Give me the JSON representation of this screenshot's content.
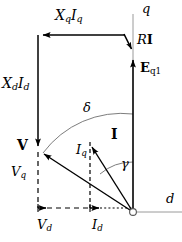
{
  "figure": {
    "type": "phasor-diagram",
    "background_color": "#ffffff",
    "stroke_color": "#000000",
    "axis_color": "#808080",
    "width": 182,
    "height": 242
  },
  "labels": {
    "xq_iq": {
      "text": "XqIq",
      "main1": "X",
      "sub1": "q",
      "main2": "I",
      "sub2": "q",
      "x": 55,
      "y": 10
    },
    "xd_id": {
      "text": "XdId",
      "main1": "X",
      "sub1": "d",
      "main2": "I",
      "sub2": "d",
      "x": 2,
      "y": 78
    },
    "q_axis": {
      "text": "q",
      "x": 142,
      "y": 4
    },
    "d_axis": {
      "text": "d",
      "x": 166,
      "y": 196
    },
    "r_i": {
      "text": "RI",
      "main1": "R",
      "main2": "I",
      "x": 137,
      "y": 35
    },
    "e_q1": {
      "text": "Eq1",
      "main1": "E",
      "sub1": "q1",
      "x": 141,
      "y": 63
    },
    "v_phasor": {
      "text": "V",
      "x": 18,
      "y": 140
    },
    "v_q": {
      "text": "Vq",
      "main1": "V",
      "sub1": "q",
      "x": 12,
      "y": 168
    },
    "v_d": {
      "text": "Vd",
      "main1": "V",
      "sub1": "d",
      "x": 38,
      "y": 220
    },
    "i_phasor": {
      "text": "I",
      "x": 112,
      "y": 129
    },
    "i_q": {
      "text": "Iq",
      "main1": "I",
      "sub1": "q",
      "x": 79,
      "y": 146
    },
    "i_d": {
      "text": "Id",
      "main1": "I",
      "sub1": "d",
      "x": 93,
      "y": 220
    },
    "delta": {
      "text": "δ",
      "x": 83,
      "y": 103
    },
    "gamma": {
      "text": "γ",
      "x": 121,
      "y": 160
    }
  },
  "geometry": {
    "origin": {
      "x": 133,
      "y": 212
    },
    "v_point": {
      "x": 38,
      "y": 150
    },
    "top_left_corner": {
      "x": 38,
      "y": 35
    },
    "top_right_corner": {
      "x": 125,
      "y": 35
    },
    "eq_tip": {
      "x": 133,
      "y": 55
    },
    "i_tip": {
      "x": 90,
      "y": 140
    },
    "q_axis_top": {
      "x": 133,
      "y": 14
    },
    "d_axis_right": {
      "x": 182,
      "y": 212
    },
    "v_foot": {
      "x": 38,
      "y": 212
    },
    "i_foot": {
      "x": 90,
      "y": 212
    }
  },
  "vectors": [
    {
      "name": "XqIq",
      "from": "top-right-corner",
      "to": "top-left-corner",
      "direction": "left",
      "style": "solid"
    },
    {
      "name": "XdId",
      "from": "top-left-corner",
      "to": "v-point",
      "direction": "down",
      "style": "solid"
    },
    {
      "name": "RI",
      "from": "top-right-corner",
      "to": "eq-tip",
      "direction": "down-right",
      "style": "solid"
    },
    {
      "name": "Eq1",
      "from": "origin",
      "to": "eq-tip",
      "direction": "up",
      "style": "solid"
    },
    {
      "name": "V",
      "from": "origin",
      "to": "v-point",
      "direction": "up-left",
      "style": "solid"
    },
    {
      "name": "I",
      "from": "origin",
      "to": "i-tip",
      "direction": "up-left",
      "style": "solid"
    },
    {
      "name": "Vd",
      "from": "v-foot",
      "to": "origin",
      "direction": "right",
      "style": "dashed"
    },
    {
      "name": "Id",
      "from": "i-foot",
      "to": "origin",
      "direction": "right",
      "style": "dotted"
    }
  ],
  "arcs": [
    {
      "name": "delta",
      "label": "δ",
      "from_axis": "q",
      "to_phasor": "V",
      "radius": 98
    },
    {
      "name": "gamma",
      "label": "γ",
      "from_axis": "q",
      "to_phasor": "I",
      "radius": 50
    }
  ]
}
